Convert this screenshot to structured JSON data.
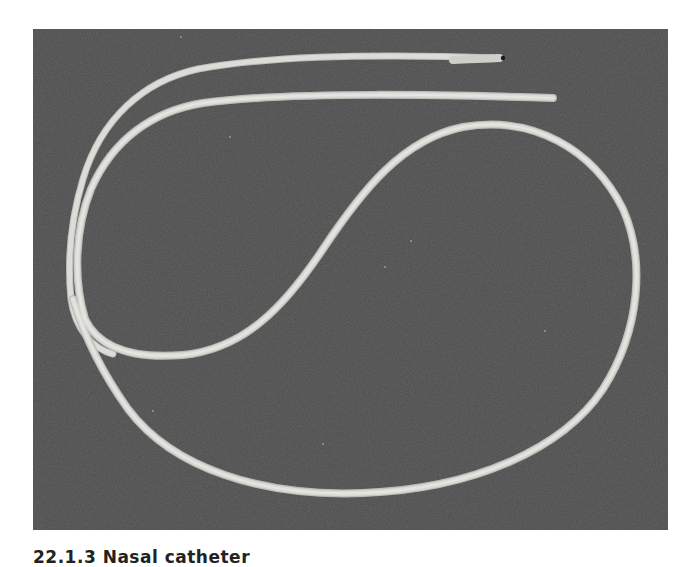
{
  "figure": {
    "background_color": "#4a4a4a",
    "tube_color": "#d9d9d6",
    "tube_shadow_color": "#bdbdb8"
  },
  "caption": {
    "text": "22.1.3 Nasal catheter",
    "clipped": true
  }
}
